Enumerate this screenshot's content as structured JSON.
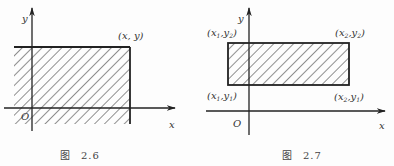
{
  "figures": [
    {
      "id": "fig-2-6",
      "caption_prefix": "图",
      "caption_number": "2.6",
      "axis_labels": {
        "x": "x",
        "y": "y",
        "origin": "O"
      },
      "corner_label": "(x, y)",
      "description": "Shaded region {(u,v): u ≤ x, v ≤ y} extending infinitely left and down from corner (x, y)"
    },
    {
      "id": "fig-2-7",
      "caption_prefix": "图",
      "caption_number": "2.7",
      "axis_labels": {
        "x": "x",
        "y": "y",
        "origin": "O"
      },
      "corners": {
        "top_left": {
          "x": "x",
          "xs": "1",
          "y": "y",
          "ys": "2"
        },
        "top_right": {
          "x": "x",
          "xs": "2",
          "y": "y",
          "ys": "2"
        },
        "bottom_left": {
          "x": "x",
          "xs": "1",
          "y": "y",
          "ys": "1"
        },
        "bottom_right": {
          "x": "x",
          "xs": "2",
          "y": "y",
          "ys": "1"
        }
      },
      "description": "Shaded rectangle with corners (x1,y1), (x2,y1), (x1,y2), (x2,y2)"
    }
  ],
  "colors": {
    "ink": "#222222",
    "hatch": "#333333",
    "background": "#fdfdfd"
  }
}
